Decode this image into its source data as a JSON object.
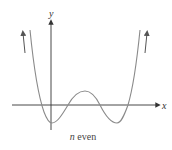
{
  "figure": {
    "caption_var": "n",
    "caption_text": " even",
    "x_axis_label": "x",
    "y_axis_label": "y"
  },
  "colors": {
    "axis": "#333333",
    "curve": "#8a8a8a",
    "arrow": "#555555"
  }
}
